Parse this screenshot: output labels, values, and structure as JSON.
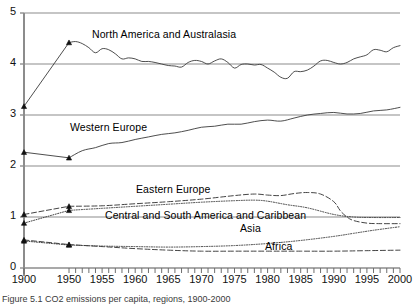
{
  "figure": {
    "caption": "Figure 5.1   CO2 emissions per capita, regions, 1900-2000"
  },
  "chart_data": {
    "type": "line",
    "title": "",
    "xlabel": "",
    "ylabel": "",
    "xlim": [
      1900,
      2000
    ],
    "ylim": [
      0,
      5
    ],
    "yticks": [
      "0",
      "1",
      "2",
      "3",
      "4",
      "5"
    ],
    "xticks": [
      "1900",
      "1950",
      "1955",
      "1960",
      "1965",
      "1970",
      "1975",
      "1980",
      "1985",
      "1990",
      "1995",
      "2000"
    ],
    "grid": "horizontal",
    "legend": "inline-annotations",
    "axis_note": "x-axis is broken: 1900 then jumps to 1950, then annual ticks to 2000",
    "series": [
      {
        "name": "North America and Australasia",
        "style": "solid",
        "markers": [
          1900,
          1950
        ],
        "label_x": 92,
        "label_y": 28,
        "x": [
          1900,
          1950,
          1951,
          1952,
          1953,
          1954,
          1955,
          1956,
          1957,
          1958,
          1959,
          1960,
          1961,
          1962,
          1963,
          1964,
          1965,
          1966,
          1967,
          1968,
          1969,
          1970,
          1971,
          1972,
          1973,
          1974,
          1975,
          1976,
          1977,
          1978,
          1979,
          1980,
          1981,
          1982,
          1983,
          1984,
          1985,
          1986,
          1987,
          1988,
          1989,
          1990,
          1991,
          1992,
          1993,
          1994,
          1995,
          1996,
          1997,
          1998,
          1999,
          2000
        ],
        "values": [
          3.17,
          4.42,
          4.44,
          4.4,
          4.32,
          4.22,
          4.3,
          4.28,
          4.2,
          4.1,
          4.12,
          4.1,
          4.05,
          4.05,
          4.03,
          4.0,
          3.97,
          3.96,
          3.94,
          4.03,
          4.07,
          4.05,
          4.0,
          4.06,
          4.1,
          4.03,
          3.92,
          3.99,
          4.0,
          3.98,
          3.99,
          3.92,
          3.84,
          3.74,
          3.72,
          3.85,
          3.85,
          3.88,
          3.96,
          4.06,
          4.07,
          4.03,
          4.0,
          4.03,
          4.1,
          4.14,
          4.18,
          4.28,
          4.27,
          4.24,
          4.32,
          4.36
        ]
      },
      {
        "name": "Western Europe",
        "style": "solid",
        "markers": [
          1900,
          1950
        ],
        "label_x": 70,
        "label_y": 121,
        "x": [
          1900,
          1950,
          1952,
          1954,
          1956,
          1958,
          1960,
          1962,
          1964,
          1966,
          1968,
          1970,
          1972,
          1974,
          1976,
          1978,
          1980,
          1982,
          1984,
          1986,
          1988,
          1990,
          1992,
          1994,
          1996,
          1998,
          2000
        ],
        "values": [
          2.27,
          2.16,
          2.3,
          2.36,
          2.44,
          2.46,
          2.52,
          2.57,
          2.62,
          2.65,
          2.7,
          2.76,
          2.78,
          2.82,
          2.82,
          2.87,
          2.9,
          2.88,
          2.94,
          3.0,
          3.03,
          3.05,
          3.02,
          3.03,
          3.08,
          3.1,
          3.15
        ]
      },
      {
        "name": "Eastern Europe",
        "style": "dashed",
        "markers": [
          1900,
          1950
        ],
        "label_x": 136,
        "label_y": 183,
        "x": [
          1900,
          1950,
          1955,
          1960,
          1965,
          1970,
          1975,
          1978,
          1980,
          1982,
          1984,
          1986,
          1988,
          1990,
          1991,
          1992,
          1993,
          1995,
          1997,
          2000
        ],
        "values": [
          1.05,
          1.21,
          1.22,
          1.26,
          1.3,
          1.35,
          1.42,
          1.45,
          1.43,
          1.42,
          1.46,
          1.48,
          1.45,
          1.3,
          1.12,
          1.0,
          0.93,
          0.88,
          0.87,
          0.87
        ]
      },
      {
        "name": "Central and South America and Caribbean",
        "style": "dotted",
        "markers": [
          1900,
          1950
        ],
        "label_x": 105,
        "label_y": 209,
        "x": [
          1900,
          1950,
          1955,
          1960,
          1965,
          1970,
          1975,
          1978,
          1980,
          1983,
          1986,
          1990,
          1993,
          1996,
          2000
        ],
        "values": [
          0.88,
          1.13,
          1.17,
          1.21,
          1.25,
          1.29,
          1.32,
          1.33,
          1.31,
          1.24,
          1.18,
          1.05,
          1.0,
          0.99,
          0.99
        ]
      },
      {
        "name": "Asia",
        "style": "dotted",
        "markers": [
          1900,
          1950
        ],
        "label_x": 240,
        "label_y": 222,
        "x": [
          1900,
          1950,
          1955,
          1960,
          1965,
          1970,
          1975,
          1980,
          1985,
          1990,
          1993,
          1996,
          2000
        ],
        "values": [
          0.53,
          0.45,
          0.43,
          0.42,
          0.41,
          0.42,
          0.44,
          0.48,
          0.54,
          0.62,
          0.68,
          0.74,
          0.81
        ]
      },
      {
        "name": "Africa",
        "style": "dashed",
        "markers": [
          1900,
          1950
        ],
        "label_x": 265,
        "label_y": 240,
        "x": [
          1900,
          1950,
          1955,
          1960,
          1965,
          1970,
          1975,
          1980,
          1985,
          1990,
          1995,
          2000
        ],
        "values": [
          0.55,
          0.46,
          0.42,
          0.38,
          0.35,
          0.33,
          0.33,
          0.33,
          0.33,
          0.33,
          0.34,
          0.35
        ]
      }
    ]
  }
}
